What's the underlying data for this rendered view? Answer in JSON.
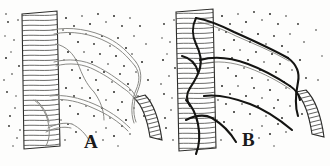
{
  "plate": {
    "title": "Comparative histological plate of motor nerve endings on striated muscle",
    "background_color": "#fdfdfc",
    "ink_color": "#1a1a1a",
    "width": 330,
    "height": 166,
    "technique": "engraving / stipple line drawing"
  },
  "panels": [
    {
      "id": "panel-a",
      "label": "A",
      "label_x": 84,
      "label_y": 132,
      "description": "Left figure: faint, thin unstained nerve fibres ramifying over a vertical striated muscle band",
      "fibre_style": "thin-faint",
      "fibre_color": "#8a8a86",
      "fibre_width": 1.0,
      "muscle_band": {
        "name": "striated-muscle-band",
        "orientation": "vertical",
        "hatch_color": "#2b2b29",
        "hatch_spacing": 4
      },
      "vessel_band": {
        "name": "curved-striated-trunk",
        "orientation": "curved",
        "hatch_color": "#2b2b29"
      },
      "stipple_color": "#2a2a28"
    },
    {
      "id": "panel-b",
      "label": "B",
      "label_x": 242,
      "label_y": 130,
      "description": "Right figure: the same field with nerve fibres heavily impregnated, appearing thick, dark and sharply outlined",
      "fibre_style": "thick-dark",
      "fibre_color": "#141412",
      "fibre_width": 2.1,
      "muscle_band": {
        "name": "striated-muscle-band",
        "orientation": "vertical",
        "hatch_color": "#2b2b29",
        "hatch_spacing": 4
      },
      "vessel_band": {
        "name": "curved-striated-trunk",
        "orientation": "curved",
        "hatch_color": "#2b2b29"
      },
      "stipple_color": "#2a2a28"
    }
  ]
}
